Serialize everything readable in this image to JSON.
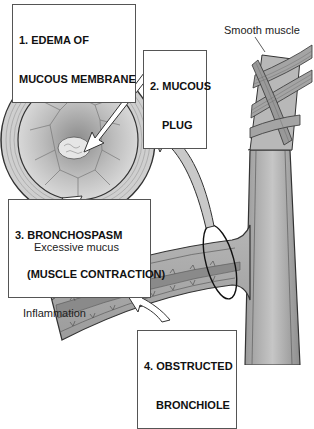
{
  "diagram": {
    "callouts": [
      {
        "id": 1,
        "line1": "1. EDEMA OF",
        "line2": "MUCOUS MEMBRANE"
      },
      {
        "id": 2,
        "line1": "2. MUCOUS",
        "line2": "PLUG"
      },
      {
        "id": 3,
        "line1": "3. BRONCHOSPASM",
        "line2": "(MUSCLE CONTRACTION)"
      },
      {
        "id": 4,
        "line1": "4. OBSTRUCTED",
        "line2": "BRONCHIOLE"
      }
    ],
    "labels": {
      "smooth_muscle": "Smooth muscle",
      "excessive_mucus": "Excessive mucus",
      "inflammation": "Inflammation"
    },
    "colors": {
      "tissue_light": "#d9d9d9",
      "tissue_mid": "#a8a8a8",
      "tissue_dark": "#7a7a7a",
      "outline": "#333333",
      "background": "#ffffff"
    }
  }
}
